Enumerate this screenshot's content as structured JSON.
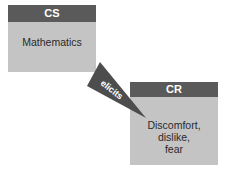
{
  "diagram": {
    "cs_box": {
      "header": "CS",
      "body": "Mathematics"
    },
    "cr_box": {
      "header": "CR",
      "body_lines": [
        "Discomfort,",
        "dislike,",
        "fear"
      ]
    },
    "arrow": {
      "label": "elicits"
    }
  },
  "colors": {
    "header_bg": "#5a5a5a",
    "box_bg": "#c4c4c4",
    "arrow": "#4d4d4d"
  }
}
